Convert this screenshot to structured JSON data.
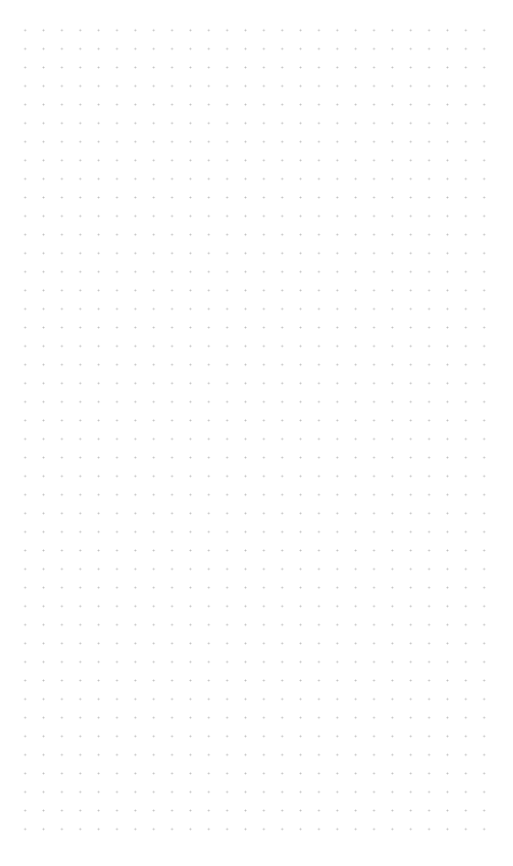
{
  "canvas": {
    "type": "dot-grid",
    "background_color": "#ffffff",
    "dot_color": "#bdbdbd",
    "columns": 26,
    "rows": 44
  }
}
